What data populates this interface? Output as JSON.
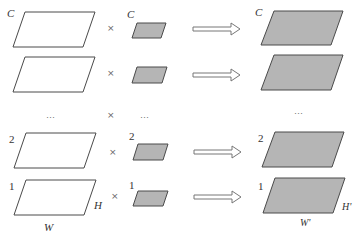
{
  "diagram": {
    "colors": {
      "stroke": "#4a4a4a",
      "output_fill": "#b5b5b5",
      "input_fill": "#ffffff",
      "arrow_fill": "#ffffff"
    },
    "rows": [
      {
        "input_label": "C",
        "weight_label": "C",
        "output_label": "C",
        "operator": "×"
      },
      {
        "input_label": "",
        "weight_label": "",
        "output_label": "",
        "operator": "×"
      },
      {
        "input_label": "…",
        "weight_label": "…",
        "output_label": "…",
        "operator": "×",
        "ellipsis": true
      },
      {
        "input_label": "2",
        "weight_label": "2",
        "output_label": "2",
        "operator": "×"
      },
      {
        "input_label": "1",
        "weight_label": "1",
        "output_label": "1",
        "operator": "×"
      }
    ],
    "dims": {
      "input_width": "W",
      "input_height": "H",
      "output_width": "W'",
      "output_height": "H'"
    }
  }
}
